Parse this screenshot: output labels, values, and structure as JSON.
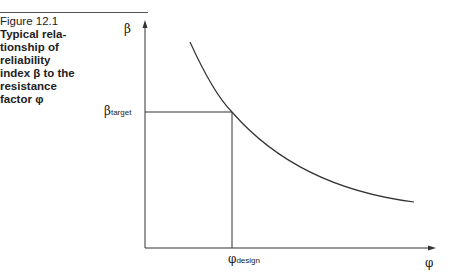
{
  "figure": {
    "number": "Figure 12.1",
    "title_lines": [
      "Typical rela-",
      "tionship of",
      "reliability",
      "index β to the",
      "resistance",
      "factor φ"
    ]
  },
  "axes": {
    "y_label": "β",
    "x_label": "φ",
    "y_marker": {
      "symbol": "β",
      "subscript": "target"
    },
    "x_marker": {
      "symbol": "φ",
      "subscript": "design"
    }
  }
}
